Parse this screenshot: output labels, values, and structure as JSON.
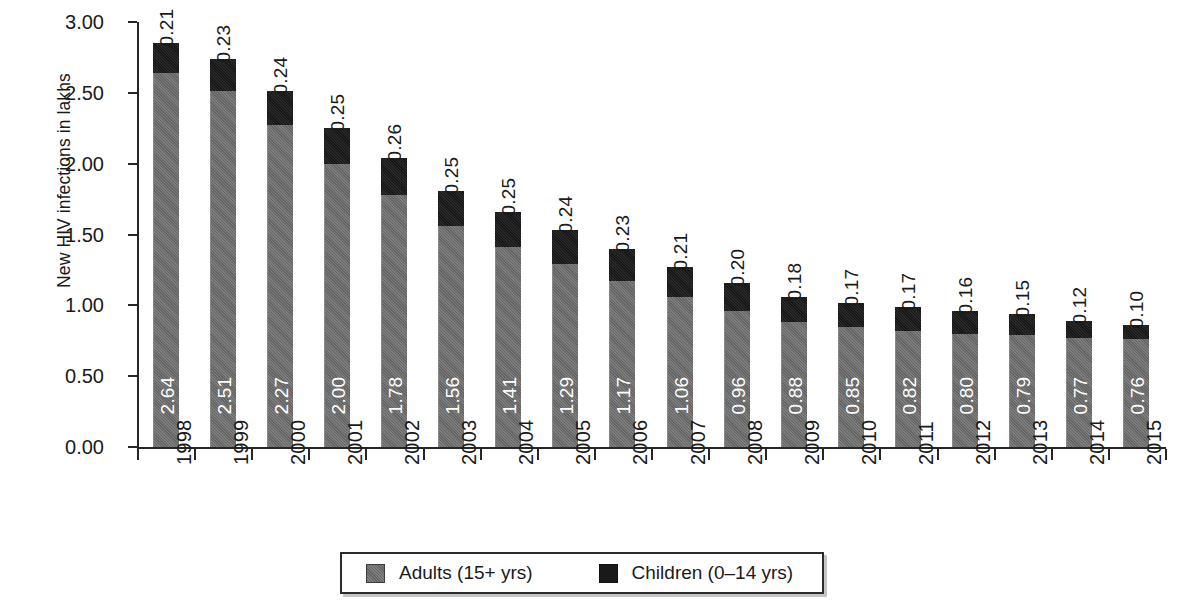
{
  "chart_data": {
    "type": "bar",
    "stacked": true,
    "title": "",
    "xlabel": "",
    "ylabel": "New HIV infections in lakhs",
    "ylim": [
      0,
      3.0
    ],
    "ytick_step": 0.5,
    "ytick_labels": [
      "3.00",
      "2.50",
      "2.00",
      "1.50",
      "1.00",
      "0.50",
      "0.00"
    ],
    "ytick_values": [
      3.0,
      2.5,
      2.0,
      1.5,
      1.0,
      0.5,
      0.0
    ],
    "grid": false,
    "legend_position": "bottom",
    "categories": [
      "1998",
      "1999",
      "2000",
      "2001",
      "2002",
      "2003",
      "2004",
      "2005",
      "2006",
      "2007",
      "2008",
      "2009",
      "2010",
      "2011",
      "2012",
      "2013",
      "2014",
      "2015"
    ],
    "series": [
      {
        "name": "Adults (15+ yrs)",
        "color": "#6f6f6f",
        "values": [
          2.64,
          2.51,
          2.27,
          2.0,
          1.78,
          1.56,
          1.41,
          1.29,
          1.17,
          1.06,
          0.96,
          0.88,
          0.85,
          0.82,
          0.8,
          0.79,
          0.77,
          0.76
        ],
        "labels": [
          "2.64",
          "2.51",
          "2.27",
          "2.00",
          "1.78",
          "1.56",
          "1.41",
          "1.29",
          "1.17",
          "1.06",
          "0.96",
          "0.88",
          "0.85",
          "0.82",
          "0.80",
          "0.79",
          "0.77",
          "0.76"
        ]
      },
      {
        "name": "Children (0–14 yrs)",
        "color": "#191919",
        "values": [
          0.21,
          0.23,
          0.24,
          0.25,
          0.26,
          0.25,
          0.25,
          0.24,
          0.23,
          0.21,
          0.2,
          0.18,
          0.17,
          0.17,
          0.16,
          0.15,
          0.12,
          0.1
        ],
        "labels": [
          "0.21",
          "0.23",
          "0.24",
          "0.25",
          "0.26",
          "0.25",
          "0.25",
          "0.24",
          "0.23",
          "0.21",
          "0.20",
          "0.18",
          "0.17",
          "0.17",
          "0.16",
          "0.15",
          "0.12",
          "0.10"
        ]
      }
    ],
    "totals": [
      2.85,
      2.74,
      2.51,
      2.25,
      2.04,
      1.81,
      1.66,
      1.53,
      1.4,
      1.27,
      1.16,
      1.06,
      1.02,
      0.99,
      0.96,
      0.94,
      0.89,
      0.86
    ]
  },
  "legend": {
    "entries": [
      {
        "label": "Adults (15+ yrs)",
        "color": "#6f6f6f"
      },
      {
        "label": "Children (0–14 yrs)",
        "color": "#191919"
      }
    ]
  },
  "axis": {
    "y_title": "New HIV infections in lakhs"
  }
}
